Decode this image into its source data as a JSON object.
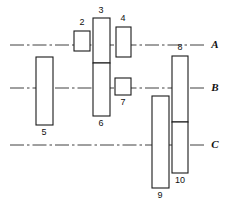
{
  "figure": {
    "type": "engineering-block-diagram",
    "background_color": "#ffffff",
    "line_color": "#1a1a1a",
    "centerline_color": "#2b2b2b",
    "width": 230,
    "height": 217
  },
  "centerlines": [
    {
      "id": "A",
      "label": "A",
      "y": 45,
      "x1": 10,
      "x2": 206,
      "label_x": 215,
      "label_y": 45,
      "style": "dash-dot"
    },
    {
      "id": "B",
      "label": "B",
      "y": 88,
      "x1": 10,
      "x2": 206,
      "label_x": 215,
      "label_y": 88,
      "style": "dash-dot"
    },
    {
      "id": "C",
      "label": "C",
      "y": 145,
      "x1": 10,
      "x2": 206,
      "label_x": 215,
      "label_y": 145,
      "style": "dash-dot"
    }
  ],
  "blocks": [
    {
      "id": "2",
      "label": "2",
      "x": 74,
      "y": 31,
      "w": 16,
      "h": 20,
      "label_x": 82,
      "label_y": 23,
      "divider_y": null
    },
    {
      "id": "3",
      "label": "3",
      "x": 93,
      "y": 18,
      "w": 17,
      "h": 45,
      "label_x": 101,
      "label_y": 11,
      "divider_y": null
    },
    {
      "id": "4",
      "label": "4",
      "x": 116,
      "y": 27,
      "w": 15,
      "h": 30,
      "label_x": 123,
      "label_y": 19,
      "divider_y": null
    },
    {
      "id": "6",
      "label": "6",
      "x": 93,
      "y": 63,
      "w": 17,
      "h": 53,
      "label_x": 101,
      "label_y": 124,
      "divider_y": null
    },
    {
      "id": "5",
      "label": "5",
      "x": 36,
      "y": 57,
      "w": 17,
      "h": 68,
      "label_x": 44,
      "label_y": 133,
      "divider_y": null
    },
    {
      "id": "7",
      "label": "7",
      "x": 115,
      "y": 78,
      "w": 16,
      "h": 17,
      "label_x": 123,
      "label_y": 103,
      "divider_y": null
    },
    {
      "id": "8",
      "label": "8",
      "x": 172,
      "y": 56,
      "w": 16,
      "h": 66,
      "label_x": 180,
      "label_y": 48,
      "divider_y": null
    },
    {
      "id": "10",
      "label": "10",
      "x": 172,
      "y": 122,
      "w": 16,
      "h": 51,
      "label_x": 180,
      "label_y": 181,
      "divider_y": null
    },
    {
      "id": "9",
      "label": "9",
      "x": 152,
      "y": 96,
      "w": 17,
      "h": 92,
      "label_x": 160,
      "label_y": 196,
      "divider_y": null
    }
  ],
  "labels_order": [
    "2",
    "3",
    "4",
    "5",
    "6",
    "7",
    "8",
    "9",
    "10"
  ],
  "axes_order": [
    "A",
    "B",
    "C"
  ]
}
